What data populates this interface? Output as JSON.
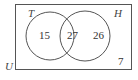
{
  "diagram": {
    "type": "venn",
    "universe_label": "U",
    "sets": [
      {
        "label": "T",
        "only_count": "15"
      },
      {
        "label": "H",
        "only_count": "26"
      }
    ],
    "intersection_count": "27",
    "outside_count": "7"
  }
}
